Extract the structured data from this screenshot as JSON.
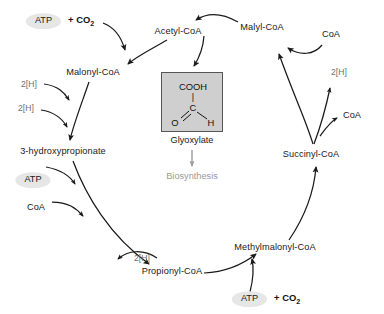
{
  "diagram": {
    "background": "#ffffff",
    "colors": {
      "arrow": "#1a1a1a",
      "cofactor_text": "#6f6f6f",
      "metabolite_text": "#1a1a1a",
      "box_fill": "#cfcfcf",
      "box_stroke": "#555555",
      "atp_ellipse": "#e6e6e6",
      "biosynthesis_gray": "#9a9a9a"
    }
  },
  "metabolites": [
    {
      "id": "acetyl_coa",
      "label": "Acetyl-CoA",
      "x": 178,
      "y": 32
    },
    {
      "id": "malyl_coa",
      "label": "Malyl-CoA",
      "x": 262,
      "y": 28
    },
    {
      "id": "malonyl_coa",
      "label": "Malonyl-CoA",
      "x": 93,
      "y": 73
    },
    {
      "id": "hydroxypropionate",
      "label": "3-hydroxypropionate",
      "x": 63,
      "y": 152
    },
    {
      "id": "propionyl_coa",
      "label": "Propionyl-CoA",
      "x": 172,
      "y": 272
    },
    {
      "id": "methylmalonyl_coa",
      "label": "Methylmalonyl-CoA",
      "x": 275,
      "y": 248
    },
    {
      "id": "succinyl_coa",
      "label": "Succinyl-CoA",
      "x": 311,
      "y": 155
    }
  ],
  "cofactors": [
    {
      "id": "h2_top_left",
      "label": "2[H]",
      "x": 29,
      "y": 84
    },
    {
      "id": "h2_mid_left",
      "label": "2[H]",
      "x": 26,
      "y": 108
    },
    {
      "id": "h2_bottom_left",
      "label": "2[H]",
      "x": 142,
      "y": 258
    },
    {
      "id": "h2_right",
      "label": "2[H]",
      "x": 339,
      "y": 72
    },
    {
      "id": "coa_right_top",
      "label": "CoA",
      "x": 331,
      "y": 35,
      "color": "dark"
    },
    {
      "id": "coa_right_mid",
      "label": "CoA",
      "x": 352,
      "y": 116,
      "color": "dark"
    },
    {
      "id": "coa_left",
      "label": "CoA",
      "x": 36,
      "y": 208,
      "color": "dark"
    }
  ],
  "atp_nodes": [
    {
      "id": "atp_top",
      "label": "ATP",
      "co2": "+ CO",
      "co2_sub": "2",
      "has_co2": true,
      "x": 60,
      "y": 21
    },
    {
      "id": "atp_left",
      "label": "ATP",
      "has_co2": false,
      "x": 33,
      "y": 180
    },
    {
      "id": "atp_bottom",
      "label": "ATP",
      "co2": "+ CO",
      "co2_sub": "2",
      "has_co2": true,
      "x": 266,
      "y": 299
    }
  ],
  "glyoxylate_box": {
    "label": "Glyoxylate",
    "structure": {
      "top": "COOH",
      "center": "C",
      "left": "O",
      "right": "H",
      "vertical_bond": "|",
      "double_bond": "=",
      "single_bond": "/"
    }
  },
  "biosynthesis": {
    "label": "Biosynthesis"
  }
}
